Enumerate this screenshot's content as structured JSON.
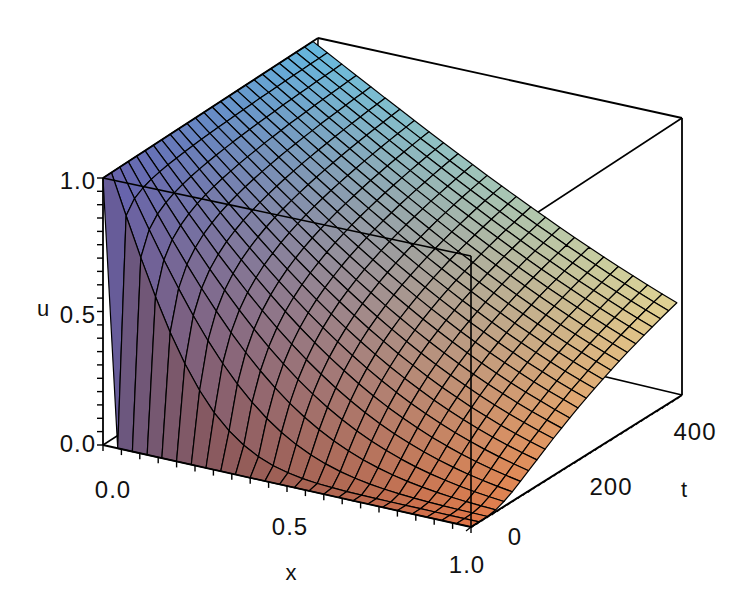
{
  "chart_data": {
    "type": "surface3d",
    "title": "",
    "model": "u(x,t) = erfc(x / (2*sqrt(D*t)))",
    "D": 0.0014,
    "surface_t_max": 400,
    "grid": {
      "nx": 25,
      "nt": 25,
      "grid_lines": true
    },
    "box": true,
    "axes": {
      "x": {
        "label": "x",
        "range": [
          0,
          1
        ],
        "ticks": [
          0.0,
          0.5,
          1.0
        ],
        "tick_labels": [
          "0.0",
          "0.5",
          "1.0"
        ],
        "minor_step": 0.05
      },
      "t": {
        "label": "t",
        "range": [
          0,
          410
        ],
        "ticks": [
          0,
          200,
          400
        ],
        "tick_labels": [
          "0",
          "200",
          "400"
        ],
        "minor_step": 10
      },
      "u": {
        "label": "u",
        "range": [
          0,
          1
        ],
        "ticks": [
          0.0,
          0.5,
          1.0
        ],
        "tick_labels": [
          "0.0",
          "0.5",
          "1.0"
        ],
        "minor_step": 0.05
      }
    },
    "samples": {
      "x": [
        0,
        0.25,
        0.5,
        0.75,
        1.0
      ],
      "t": [
        0,
        100,
        200,
        300,
        400
      ],
      "u": [
        [
          1,
          0,
          0,
          0,
          0
        ],
        [
          1,
          0.637,
          0.345,
          0.156,
          0.057
        ],
        [
          1,
          0.739,
          0.503,
          0.316,
          0.181
        ],
        [
          1,
          0.785,
          0.585,
          0.413,
          0.275
        ],
        [
          1,
          0.813,
          0.637,
          0.479,
          0.345
        ]
      ]
    },
    "shading": {
      "comment": "channel = c0 + cx*x + ct*(t/400) + cu*u",
      "r": [
        100,
        125,
        0,
        0
      ],
      "g": [
        75,
        40,
        90,
        20
      ],
      "b": [
        95,
        -25,
        50,
        80
      ],
      "representative_colors": {
        "top_left_u1": "#6468aa",
        "back_top": "#78b4e0",
        "right_edge": "#d8d890",
        "front_right_low": "#e07858",
        "left_wall_low": "#6a5058"
      }
    },
    "line_color": "#000000",
    "background": "#ffffff"
  }
}
